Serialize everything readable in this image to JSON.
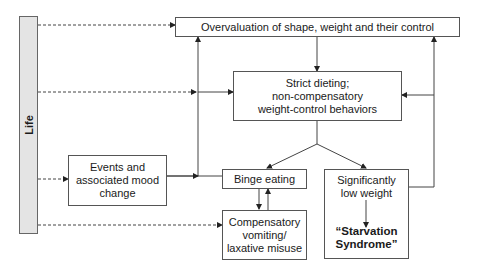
{
  "diagram": {
    "life_bar": {
      "label": "Life",
      "fill": "#e4e4e4"
    },
    "nodes": {
      "overvaluation": {
        "label": "Overvaluation of shape, weight and their control"
      },
      "strict_dieting": {
        "line1": "Strict dieting;",
        "line2": "non-compensatory",
        "line3": "weight-control behaviors"
      },
      "events": {
        "line1": "Events and",
        "line2": "associated mood",
        "line3": "change"
      },
      "binge_eating": {
        "label": "Binge eating"
      },
      "compensatory": {
        "line1": "Compensatory",
        "line2": "vomiting/",
        "line3": "laxative misuse"
      },
      "low_weight": {
        "line1": "Significantly",
        "line2": "low weight"
      },
      "starvation": {
        "line1": "“Starvation",
        "line2": "Syndrome”"
      }
    },
    "edges": [
      {
        "from": "Life",
        "to": "Overvaluation of shape, weight and their control",
        "style": "dashed"
      },
      {
        "from": "Life",
        "to": "Strict dieting; non-compensatory weight-control behaviors",
        "style": "dashed"
      },
      {
        "from": "Life",
        "to": "Events and associated mood change",
        "style": "dashed"
      },
      {
        "from": "Life",
        "to": "Compensatory vomiting/laxative misuse",
        "style": "dashed"
      },
      {
        "from": "Overvaluation of shape, weight and their control",
        "to": "Strict dieting; non-compensatory weight-control behaviors",
        "style": "solid"
      },
      {
        "from": "Strict dieting; non-compensatory weight-control behaviors",
        "to": "Binge eating",
        "style": "solid"
      },
      {
        "from": "Strict dieting; non-compensatory weight-control behaviors",
        "to": "Significantly low weight",
        "style": "solid"
      },
      {
        "from": "Events and associated mood change",
        "to": "Binge eating",
        "style": "solid"
      },
      {
        "from": "Binge eating",
        "to": "Overvaluation of shape, weight and their control",
        "style": "solid"
      },
      {
        "from": "Binge eating",
        "to": "Strict dieting; non-compensatory weight-control behaviors",
        "style": "solid"
      },
      {
        "from": "Binge eating",
        "to": "Compensatory vomiting/laxative misuse",
        "style": "solid"
      },
      {
        "from": "Compensatory vomiting/laxative misuse",
        "to": "Binge eating",
        "style": "solid"
      },
      {
        "from": "Significantly low weight",
        "to": "Overvaluation of shape, weight and their control",
        "style": "solid"
      },
      {
        "from": "Significantly low weight",
        "to": "Strict dieting; non-compensatory weight-control behaviors",
        "style": "solid"
      },
      {
        "from": "Significantly low weight",
        "to": "“Starvation Syndrome”",
        "style": "solid"
      }
    ],
    "colors": {
      "line": "#444444",
      "border": "#555555",
      "life_fill": "#e4e4e4"
    }
  }
}
